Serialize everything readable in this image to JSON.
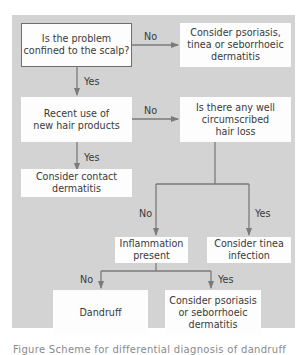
{
  "flowchart": {
    "nodes": {
      "q_scalp": "Is the problem confined to the scalp?",
      "c_psoriasis_tinea": "Consider psoriasis, tinea or seborrhoeic dermatitis",
      "q_products": "Recent use of new hair products",
      "q_hairloss": "Is there any well circumscribed hair loss",
      "c_contact": "Consider contact dermatitis",
      "q_inflammation": "Inflammation present",
      "c_tinea": "Consider tinea infection",
      "r_dandruff": "Dandruff",
      "c_psoriasis_sebo": "Consider psoriasis or seborrhoeic dermatitis"
    },
    "edge_labels": {
      "scalp_no": "No",
      "scalp_yes": "Yes",
      "products_no": "No",
      "products_yes": "Yes",
      "hairloss_no": "No",
      "hairloss_yes": "Yes",
      "inflammation_no": "No",
      "inflammation_yes": "Yes"
    },
    "colors": {
      "panel": "#d3d3d3",
      "box": "#fdfdfd",
      "line": "#7a7a7a",
      "text": "#3a3a3a"
    }
  },
  "caption": "Figure     Scheme for differential diagnosis of dandruff"
}
